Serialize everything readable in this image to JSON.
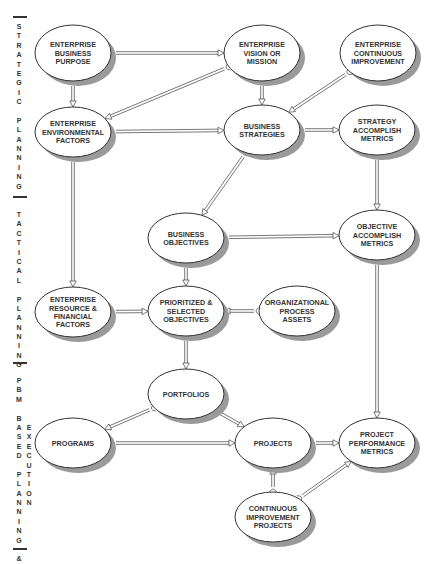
{
  "diagram": {
    "colors": {
      "node_fill": "#ffffff",
      "node_stroke": "#333333",
      "shadow": "#9a9a9a",
      "text": "#333333",
      "connector": "#555555"
    },
    "side_sections": [
      {
        "id": "strategic",
        "columns": [
          [
            "S",
            "T",
            "R",
            "A",
            "T",
            "E",
            "G",
            "I",
            "C",
            "",
            "P",
            "L",
            "A",
            "N",
            "N",
            "I",
            "N",
            "G"
          ]
        ]
      },
      {
        "id": "tactical",
        "columns": [
          [
            "T",
            "A",
            "C",
            "T",
            "I",
            "C",
            "A",
            "L",
            "",
            "P",
            "L",
            "A",
            "N",
            "N",
            "I",
            "N",
            "G"
          ]
        ]
      },
      {
        "id": "pbm",
        "columns": [
          [
            "P",
            "B",
            "M",
            "",
            "B",
            "A",
            "S",
            "E",
            "D",
            "",
            "P",
            "L",
            "A",
            "N",
            "N",
            "I",
            "N",
            "G",
            "",
            "&"
          ],
          [
            "E",
            "X",
            "E",
            "C",
            "U",
            "T",
            "I",
            "O",
            "N"
          ]
        ]
      }
    ],
    "nodes": [
      {
        "id": "ebp",
        "lines": [
          "ENTERPRISE",
          "BUSINESS",
          "PURPOSE"
        ],
        "cx": 73,
        "cy": 53,
        "rx": 38,
        "ry": 28
      },
      {
        "id": "evm",
        "lines": [
          "ENTERPRISE",
          "VISION OR",
          "MISSION"
        ],
        "cx": 262,
        "cy": 53,
        "rx": 38,
        "ry": 28
      },
      {
        "id": "eci",
        "lines": [
          "ENTERPRISE",
          "CONTINUOUS",
          "IMPROVEMENT"
        ],
        "cx": 378,
        "cy": 53,
        "rx": 38,
        "ry": 28
      },
      {
        "id": "eef",
        "lines": [
          "ENTERPRISE",
          "ENVIRONMENTAL",
          "FACTORS"
        ],
        "cx": 73,
        "cy": 132,
        "rx": 38,
        "ry": 25
      },
      {
        "id": "bs",
        "lines": [
          "BUSINESS",
          "STRATEGIES"
        ],
        "cx": 262,
        "cy": 130,
        "rx": 38,
        "ry": 25
      },
      {
        "id": "sam",
        "lines": [
          "STRATEGY",
          "ACCOMPLISH",
          "METRICS"
        ],
        "cx": 377,
        "cy": 130,
        "rx": 38,
        "ry": 25
      },
      {
        "id": "bo",
        "lines": [
          "BUSINESS",
          "OBJECTIVES"
        ],
        "cx": 186,
        "cy": 238,
        "rx": 38,
        "ry": 25
      },
      {
        "id": "oam",
        "lines": [
          "OBJECTIVE",
          "ACCOMPLISH",
          "METRICS"
        ],
        "cx": 377,
        "cy": 235,
        "rx": 38,
        "ry": 25
      },
      {
        "id": "erf",
        "lines": [
          "ENTERPRISE",
          "RESOURCE &",
          "FINANCIAL",
          "FACTORS"
        ],
        "cx": 73,
        "cy": 312,
        "rx": 38,
        "ry": 25
      },
      {
        "id": "pso",
        "lines": [
          "PRIORITIZED &",
          "SELECTED",
          "OBJECTIVES"
        ],
        "cx": 186,
        "cy": 311,
        "rx": 38,
        "ry": 25
      },
      {
        "id": "opa",
        "lines": [
          "ORGANIZATIONAL",
          "PROCESS",
          "ASSETS"
        ],
        "cx": 297,
        "cy": 311,
        "rx": 38,
        "ry": 25
      },
      {
        "id": "port",
        "lines": [
          "PORTFOLIOS"
        ],
        "cx": 186,
        "cy": 394,
        "rx": 38,
        "ry": 25
      },
      {
        "id": "prog",
        "lines": [
          "PROGRAMS"
        ],
        "cx": 73,
        "cy": 443,
        "rx": 38,
        "ry": 25
      },
      {
        "id": "proj",
        "lines": [
          "PROJECTS"
        ],
        "cx": 273,
        "cy": 443,
        "rx": 38,
        "ry": 25
      },
      {
        "id": "ppm",
        "lines": [
          "PROJECT",
          "PERFORMANCE",
          "METRICS"
        ],
        "cx": 377,
        "cy": 443,
        "rx": 38,
        "ry": 25
      },
      {
        "id": "cip",
        "lines": [
          "CONTINUOUS",
          "IMPROVEMENT",
          "PROJECTS"
        ],
        "cx": 273,
        "cy": 517,
        "rx": 38,
        "ry": 25
      }
    ],
    "edges": [
      {
        "from": "ebp",
        "to": "evm"
      },
      {
        "from": "ebp",
        "to": "eef"
      },
      {
        "from": "evm",
        "to": "eef"
      },
      {
        "from": "evm",
        "to": "bs"
      },
      {
        "from": "eci",
        "to": "bs"
      },
      {
        "from": "eef",
        "to": "bs"
      },
      {
        "from": "bs",
        "to": "sam"
      },
      {
        "from": "eef",
        "to": "erf"
      },
      {
        "from": "bs",
        "to": "bo"
      },
      {
        "from": "sam",
        "to": "oam"
      },
      {
        "from": "bo",
        "to": "oam"
      },
      {
        "from": "bo",
        "to": "pso"
      },
      {
        "from": "erf",
        "to": "pso"
      },
      {
        "from": "opa",
        "to": "pso"
      },
      {
        "from": "pso",
        "to": "port"
      },
      {
        "from": "port",
        "to": "prog"
      },
      {
        "from": "port",
        "to": "proj"
      },
      {
        "from": "prog",
        "to": "proj"
      },
      {
        "from": "proj",
        "to": "ppm"
      },
      {
        "from": "oam",
        "to": "ppm"
      },
      {
        "from": "cip",
        "to": "proj"
      },
      {
        "from": "cip",
        "to": "ppm"
      }
    ]
  }
}
